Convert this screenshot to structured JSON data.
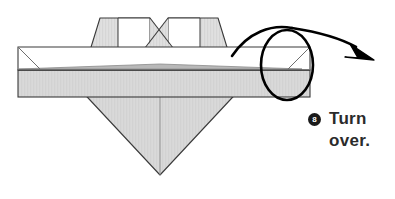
{
  "page": {
    "background_color": "#ffffff",
    "width": 395,
    "height": 199
  },
  "instruction": {
    "step_number": "8",
    "line1": "Turn",
    "line2": "over.",
    "full_text": "Turn over.",
    "badge_color": "#1a1a1a",
    "badge_text_color": "#ffffff",
    "text_color": "#2b2b2b"
  },
  "diagram": {
    "name": "origami-turn-over-step",
    "type": "origami-instruction",
    "paper_front_color": "#ffffff",
    "paper_back_color": "#d6d6d6",
    "shadow_color": "#c2c2c2",
    "outline_color": "#3a3a3a",
    "crease_color": "#6e6e6e",
    "arrow_color": "#000000",
    "shapes": {
      "band_left_x": 18,
      "band_right_x": 310,
      "band_top_y": 47,
      "band_mid_y": 70,
      "band_bottom_y": 97,
      "peak_top_y": 18,
      "left_peak_x": [
        100,
        150
      ],
      "right_peak_x": [
        168,
        218
      ],
      "center_x": 160,
      "diamond_bottom_y": 175,
      "diamond_left_x": 62,
      "diamond_right_x": 258
    },
    "turn_arrow": {
      "name": "turn-over-arrow",
      "loop_center_x": 287,
      "loop_center_y": 65,
      "loop_rx": 26,
      "loop_ry": 35,
      "arrow_tip_x": 372,
      "arrow_tip_y": 58
    }
  }
}
